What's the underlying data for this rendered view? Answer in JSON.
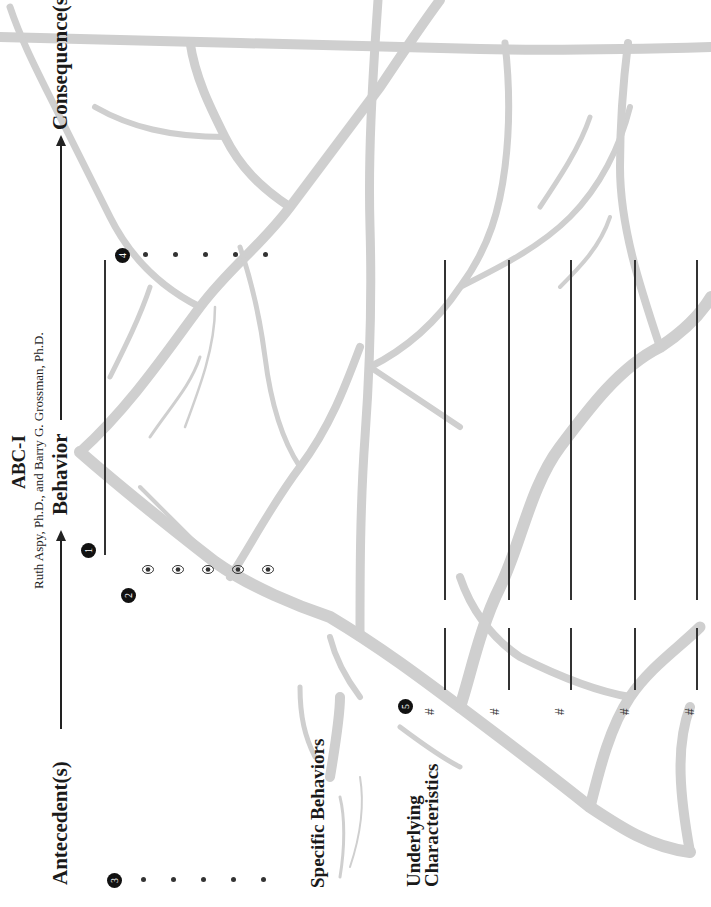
{
  "document": {
    "title": "ABC-I",
    "authors": "Ruth Aspy, Ph.D., and Barry G. Grossman, Ph.D.",
    "orientation": "landscape, rotated 90° counter-clockwise",
    "colors": {
      "text": "#1a1a1a",
      "badge": "#111111",
      "tree": "#cfcfcf",
      "rule": "#333333"
    }
  },
  "flow_header": {
    "antecedent_label": "Antecedent(s)",
    "behavior_label": "Behavior",
    "consequence_label": "Consequence(s)",
    "arrow_icon": "right-arrow-icon"
  },
  "badges": [
    {
      "number": "1",
      "meaning": "behavior description line"
    },
    {
      "number": "2",
      "meaning": "specific behavior checkpoints"
    },
    {
      "number": "3",
      "meaning": "antecedent bullet list"
    },
    {
      "number": "4",
      "meaning": "consequence bullet list"
    },
    {
      "number": "5",
      "meaning": "underlying characteristic numbered lines"
    }
  ],
  "antecedents": {
    "bullet_count": 5,
    "items": [
      "",
      "",
      "",
      "",
      ""
    ]
  },
  "consequences": {
    "bullet_count": 5,
    "items": [
      "",
      "",
      "",
      "",
      ""
    ]
  },
  "behavior": {
    "line_value": ""
  },
  "specific_behaviors": {
    "label": "Specific Behaviors",
    "eye_icon_count": 5,
    "icon": "eye-icon"
  },
  "underlying_characteristics": {
    "label_line1": "Underlying",
    "label_line2": "Characteristics",
    "rows": [
      {
        "number_symbol": "#",
        "value": ""
      },
      {
        "number_symbol": "#",
        "value": ""
      },
      {
        "number_symbol": "#",
        "value": ""
      },
      {
        "number_symbol": "#",
        "value": ""
      },
      {
        "number_symbol": "#",
        "value": ""
      }
    ]
  }
}
